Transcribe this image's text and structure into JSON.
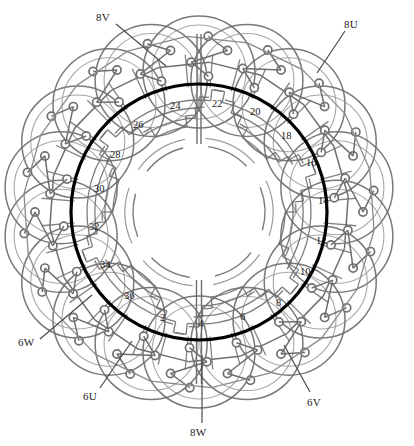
{
  "diagram": {
    "type": "motor-stator-winding-diagram",
    "title": "",
    "slot_count": 36,
    "colors": {
      "bore_circle": "#000000",
      "winding_line": "#6e6e6e",
      "winding_line_light": "#8a8a8a",
      "node_stroke": "#707070",
      "leader_line": "#4a4a4a",
      "label_text": "#1a1a1a",
      "background": "#ffffff"
    },
    "geometry": {
      "center_x": 199,
      "center_y": 212,
      "bore_radius": 128,
      "inner_arc_radius": 95,
      "hub_radius": 62,
      "outer_loop_radius": 56,
      "outer_loop_center_radius": 140,
      "outer_loop_count": 18
    },
    "terminals": [
      {
        "id": "t-8V",
        "label": "8V",
        "x": 96,
        "y": 11,
        "lx": 116,
        "ly": 24,
        "ex": 166,
        "ey": 66
      },
      {
        "id": "t-8U",
        "label": "8U",
        "x": 344,
        "y": 18,
        "lx": 345,
        "ly": 31,
        "ex": 317,
        "ey": 73
      },
      {
        "id": "t-6W",
        "label": "6W",
        "x": 18,
        "y": 336,
        "lx": 40,
        "ly": 339,
        "ex": 92,
        "ey": 295
      },
      {
        "id": "t-6U",
        "label": "6U",
        "x": 83,
        "y": 390,
        "lx": 100,
        "ly": 388,
        "ex": 132,
        "ey": 341
      },
      {
        "id": "t-8W",
        "label": "8W",
        "x": 190,
        "y": 426,
        "lx": 202,
        "ly": 423,
        "ex": 202,
        "ey": 355
      },
      {
        "id": "t-6V",
        "label": "6V",
        "x": 307,
        "y": 396,
        "lx": 310,
        "ly": 392,
        "ex": 284,
        "ey": 345
      }
    ],
    "slot_numbers": [
      {
        "label": "2",
        "x": 160,
        "y": 312
      },
      {
        "label": "4",
        "x": 198,
        "y": 318
      },
      {
        "label": "6",
        "x": 240,
        "y": 311
      },
      {
        "label": "8",
        "x": 276,
        "y": 297
      },
      {
        "label": "10",
        "x": 300,
        "y": 266
      },
      {
        "label": "12",
        "x": 316,
        "y": 235
      },
      {
        "label": "14",
        "x": 318,
        "y": 195
      },
      {
        "label": "16",
        "x": 306,
        "y": 157
      },
      {
        "label": "18",
        "x": 281,
        "y": 130
      },
      {
        "label": "20",
        "x": 250,
        "y": 106
      },
      {
        "label": "22",
        "x": 212,
        "y": 98
      },
      {
        "label": "24",
        "x": 170,
        "y": 100
      },
      {
        "label": "26",
        "x": 133,
        "y": 119
      },
      {
        "label": "28",
        "x": 110,
        "y": 149
      },
      {
        "label": "30",
        "x": 94,
        "y": 183
      },
      {
        "label": "32",
        "x": 89,
        "y": 221
      },
      {
        "label": "34",
        "x": 100,
        "y": 259
      },
      {
        "label": "36",
        "x": 124,
        "y": 290
      }
    ]
  }
}
